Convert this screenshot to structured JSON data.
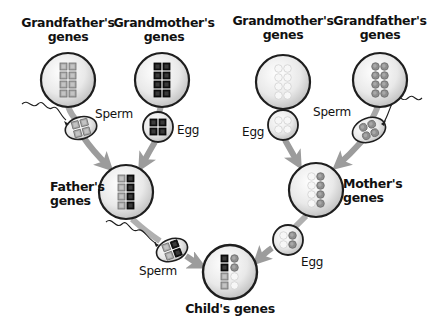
{
  "labels": {
    "paternal_grandfather": "Grandfather's genes",
    "paternal_grandfather_line1": "Grandfather's",
    "paternal_grandfather_line2": "genes",
    "paternal_grandmother_line1": "Grandmother's",
    "paternal_grandmother_line2": "genes",
    "maternal_grandmother_line1": "Grandmother's",
    "maternal_grandmother_line2": "genes",
    "maternal_grandfather_line1": "Grandfather's",
    "maternal_grandfather_line2": "genes",
    "father_line1": "Father's",
    "father_line2": "genes",
    "mother_line1": "Mother's",
    "mother_line2": "genes",
    "child": "Child's genes",
    "sperm_left": "Sperm",
    "egg_left": "Egg",
    "egg_right": "Egg",
    "sperm_right": "Sperm",
    "sperm_father": "Sperm",
    "egg_mother": "Egg"
  },
  "gene_styles": {
    "paternal_grandfather": {
      "shape": "square",
      "fill": "#9a9a9a"
    },
    "paternal_grandmother": {
      "shape": "square",
      "fill": "#1a1a1a"
    },
    "maternal_grandmother": {
      "shape": "circle",
      "fill": "#f2f2f2"
    },
    "maternal_grandfather": {
      "shape": "circle",
      "fill": "#8a8a8a"
    }
  },
  "colors": {
    "arrow": "#9c9c9c",
    "cell_outline": "#1e1e1e",
    "cell_fill_center": "#fafafa",
    "cell_fill_edge": "#c8c8c8",
    "text": "#111111"
  }
}
